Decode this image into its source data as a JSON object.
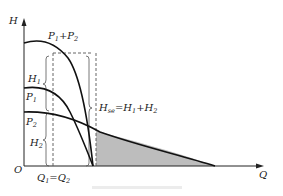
{
  "diagram": {
    "type": "pump-series-characteristic",
    "axes": {
      "y_label": "H",
      "x_label": "Q",
      "origin_label": "O"
    },
    "curves": [
      {
        "id": "p1p2",
        "label_main": "P",
        "label_sub1": "1",
        "label_plus": "+P",
        "label_sub2": "2"
      },
      {
        "id": "p1",
        "label_main": "P",
        "label_sub": "1"
      },
      {
        "id": "p2",
        "label_main": "P",
        "label_sub": "2"
      }
    ],
    "annotations": {
      "h1": {
        "main": "H",
        "sub": "1"
      },
      "h2": {
        "main": "H",
        "sub": "2"
      },
      "hse": {
        "main": "H",
        "sub": "se",
        "eq": "=H",
        "sub1": "1",
        "plus": "+H",
        "sub2": "2"
      },
      "q": {
        "main": "Q",
        "sub1": "1",
        "eq": "=Q",
        "sub2": "2"
      }
    },
    "colors": {
      "curve": "#111111",
      "axis": "#222222",
      "dashed": "#555555",
      "shade": "#bdbdbd"
    }
  }
}
